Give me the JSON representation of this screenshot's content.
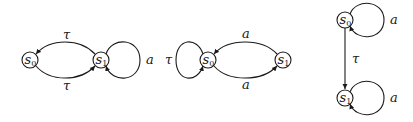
{
  "diagrams": [
    {
      "id": "left",
      "states": [
        {
          "name": "s",
          "sub": "0"
        },
        {
          "name": "s",
          "sub": "1"
        }
      ],
      "transitions": [
        {
          "from": "s1",
          "to": "s0",
          "label": "τ",
          "position": "top"
        },
        {
          "from": "s0",
          "to": "s1",
          "label": "τ",
          "position": "bottom"
        },
        {
          "from": "s1",
          "to": "s1",
          "label": "a",
          "position": "right-loop"
        }
      ]
    },
    {
      "id": "middle",
      "states": [
        {
          "name": "s",
          "sub": "0"
        },
        {
          "name": "s",
          "sub": "1"
        }
      ],
      "transitions": [
        {
          "from": "s0",
          "to": "s0",
          "label": "τ",
          "position": "left-loop"
        },
        {
          "from": "s1",
          "to": "s0",
          "label": "a",
          "position": "top"
        },
        {
          "from": "s0",
          "to": "s1",
          "label": "a",
          "position": "bottom"
        }
      ]
    },
    {
      "id": "right",
      "states": [
        {
          "name": "s",
          "sub": "0"
        },
        {
          "name": "s",
          "sub": "1"
        }
      ],
      "transitions": [
        {
          "from": "s0",
          "to": "s0",
          "label": "a",
          "position": "right-loop"
        },
        {
          "from": "s0",
          "to": "s1",
          "label": "τ",
          "position": "vertical"
        },
        {
          "from": "s1",
          "to": "s1",
          "label": "a",
          "position": "right-loop"
        }
      ]
    }
  ],
  "colors": {
    "stroke": "#1a1a1a",
    "background": "#ffffff"
  }
}
